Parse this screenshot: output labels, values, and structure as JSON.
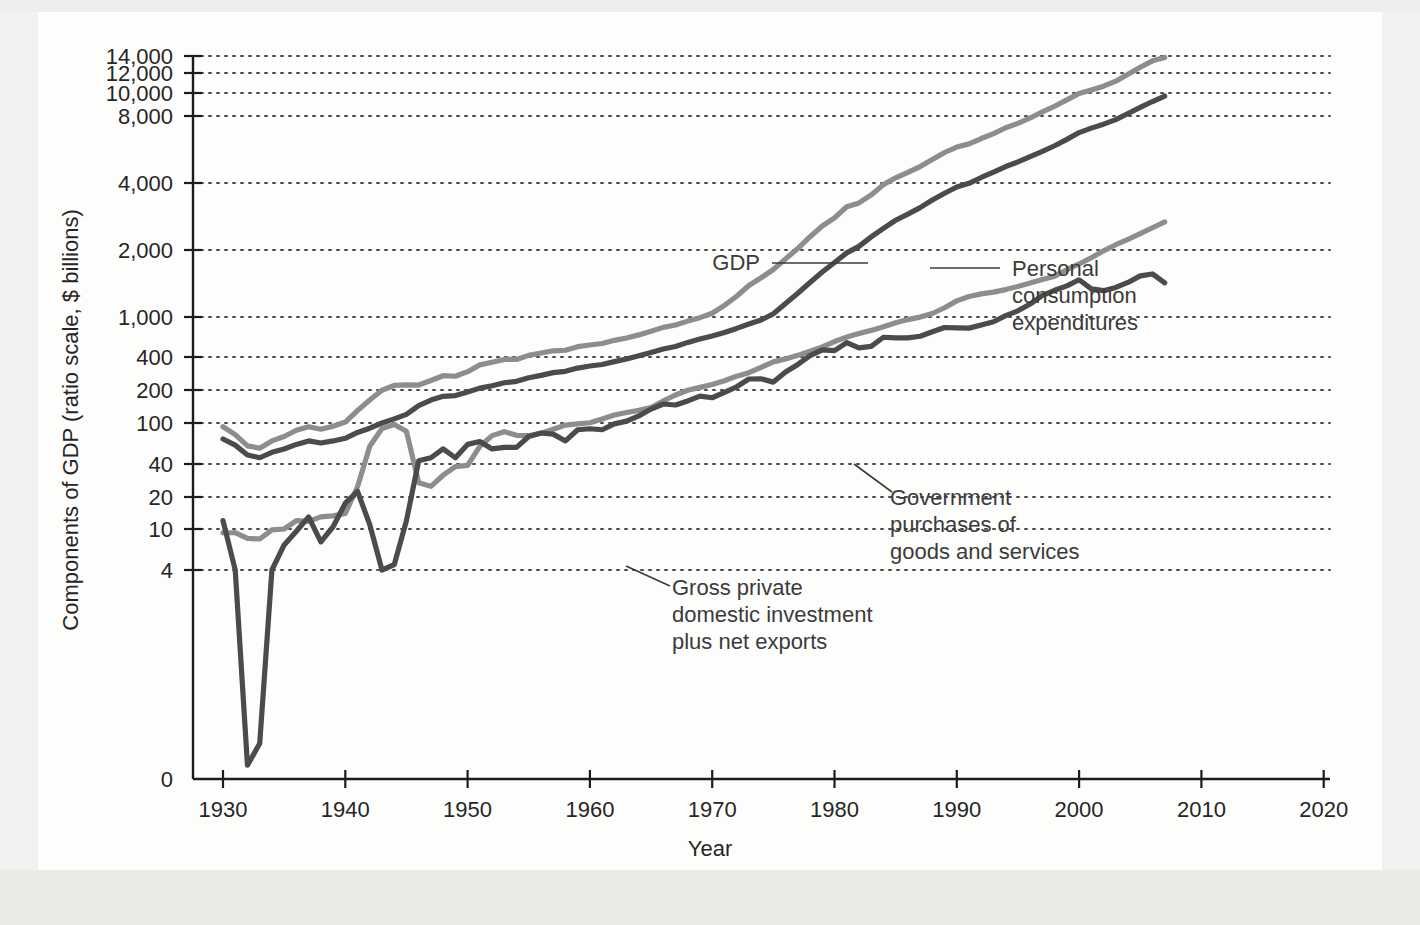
{
  "figure": {
    "y_axis_title": "Components of GDP (ratio scale, $ billions)",
    "x_axis_title": "Year"
  },
  "annotations": {
    "gdp": {
      "label": "GDP"
    },
    "pce": {
      "line1": "Personal",
      "line2": "consumption",
      "line3": "expenditures"
    },
    "gov": {
      "line1": "Government",
      "line2": "purchases of",
      "line3": "goods and services"
    },
    "inv": {
      "line1": "Gross private",
      "line2": "domestic investment",
      "line3": "plus net exports"
    }
  },
  "ticks": {
    "y": [
      "14,000",
      "12,000",
      "10,000",
      "8,000",
      "4,000",
      "2,000",
      "1,000",
      "400",
      "200",
      "100",
      "40",
      "20",
      "10",
      "4",
      "0"
    ],
    "x": [
      "1930",
      "1940",
      "1950",
      "1960",
      "1970",
      "1980",
      "1990",
      "2000",
      "2010",
      "2020"
    ]
  },
  "colors": {
    "light_series": "#8d8d8d",
    "dark_series": "#4b4b4b",
    "axis": "#1c1c1c",
    "grid": "#4a4a4a",
    "panel_background": "#fdfdfc",
    "page_background": "#f2f1ef"
  },
  "chart_data": {
    "type": "line",
    "title": "",
    "xlabel": "Year",
    "ylabel": "Components of GDP (ratio scale, $ billions)",
    "yscale": "log",
    "ylim": [
      4,
      14000
    ],
    "xlim": [
      1928,
      2022
    ],
    "grid": true,
    "legend": "inline-annotations",
    "ytick_values": [
      14000,
      12000,
      10000,
      8000,
      4000,
      2000,
      1000,
      400,
      200,
      100,
      40,
      20,
      10,
      4,
      0
    ],
    "xtick_values": [
      1930,
      1940,
      1950,
      1960,
      1970,
      1980,
      1990,
      2000,
      2010,
      2020
    ],
    "series": [
      {
        "name": "GDP",
        "color": "#8d8d8d",
        "x": [
          1930,
          1931,
          1932,
          1933,
          1934,
          1935,
          1936,
          1937,
          1938,
          1939,
          1940,
          1941,
          1942,
          1943,
          1944,
          1945,
          1946,
          1947,
          1948,
          1949,
          1950,
          1951,
          1952,
          1953,
          1954,
          1955,
          1956,
          1957,
          1958,
          1959,
          1960,
          1961,
          1962,
          1963,
          1964,
          1965,
          1966,
          1967,
          1968,
          1969,
          1970,
          1971,
          1972,
          1973,
          1974,
          1975,
          1976,
          1977,
          1978,
          1979,
          1980,
          1981,
          1982,
          1983,
          1984,
          1985,
          1986,
          1987,
          1988,
          1989,
          1990,
          1991,
          1992,
          1993,
          1994,
          1995,
          1996,
          1997,
          1998,
          1999,
          2000,
          2001,
          2002,
          2003,
          2004,
          2005,
          2006,
          2007
        ],
        "y": [
          92,
          77,
          60,
          57,
          67,
          74,
          85,
          92,
          87,
          93,
          102,
          130,
          162,
          199,
          220,
          223,
          222,
          244,
          270,
          267,
          294,
          339,
          358,
          380,
          380,
          415,
          438,
          461,
          467,
          507,
          527,
          545,
          586,
          618,
          664,
          720,
          788,
          833,
          910,
          985,
          1039,
          1128,
          1240,
          1385,
          1501,
          1635,
          1824,
          2031,
          2295,
          2563,
          2790,
          3128,
          3255,
          3537,
          3933,
          4220,
          4463,
          4740,
          5104,
          5484,
          5803,
          5996,
          6338,
          6667,
          7085,
          7415,
          7839,
          8332,
          8794,
          9354,
          9952,
          10286,
          10642,
          11142,
          11868,
          12638,
          13399,
          13808
        ]
      },
      {
        "name": "Personal consumption expenditures",
        "color": "#4b4b4b",
        "x": [
          1930,
          1931,
          1932,
          1933,
          1934,
          1935,
          1936,
          1937,
          1938,
          1939,
          1940,
          1941,
          1942,
          1943,
          1944,
          1945,
          1946,
          1947,
          1948,
          1949,
          1950,
          1951,
          1952,
          1953,
          1954,
          1955,
          1956,
          1957,
          1958,
          1959,
          1960,
          1961,
          1962,
          1963,
          1964,
          1965,
          1966,
          1967,
          1968,
          1969,
          1970,
          1971,
          1972,
          1973,
          1974,
          1975,
          1976,
          1977,
          1978,
          1979,
          1980,
          1981,
          1982,
          1983,
          1984,
          1985,
          1986,
          1987,
          1988,
          1989,
          1990,
          1991,
          1992,
          1993,
          1994,
          1995,
          1996,
          1997,
          1998,
          1999,
          2000,
          2001,
          2002,
          2003,
          2004,
          2005,
          2006,
          2007
        ],
        "y": [
          70,
          61,
          49,
          46,
          52,
          56,
          62,
          67,
          64,
          67,
          71,
          81,
          89,
          100,
          109,
          120,
          144,
          162,
          175,
          178,
          192,
          208,
          219,
          233,
          240,
          259,
          272,
          288,
          296,
          317,
          331,
          342,
          363,
          383,
          412,
          444,
          481,
          509,
          559,
          604,
          648,
          702,
          770,
          852,
          933,
          1034,
          1151,
          1278,
          1428,
          1592,
          1757,
          1941,
          2077,
          2290,
          2503,
          2720,
          2899,
          3100,
          3353,
          3598,
          3840,
          3986,
          4235,
          4478,
          4743,
          4976,
          5257,
          5547,
          5880,
          6282,
          6739,
          7055,
          7351,
          7704,
          8196,
          8694,
          9207,
          9710
        ]
      },
      {
        "name": "Government purchases of goods and services",
        "color": "#8d8d8d",
        "x": [
          1930,
          1931,
          1932,
          1933,
          1934,
          1935,
          1936,
          1937,
          1938,
          1939,
          1940,
          1941,
          1942,
          1943,
          1944,
          1945,
          1946,
          1947,
          1948,
          1949,
          1950,
          1951,
          1952,
          1953,
          1954,
          1955,
          1956,
          1957,
          1958,
          1959,
          1960,
          1961,
          1962,
          1963,
          1964,
          1965,
          1966,
          1967,
          1968,
          1969,
          1970,
          1971,
          1972,
          1973,
          1974,
          1975,
          1976,
          1977,
          1978,
          1979,
          1980,
          1981,
          1982,
          1983,
          1984,
          1985,
          1986,
          1987,
          1988,
          1989,
          1990,
          1991,
          1992,
          1993,
          1994,
          1995,
          1996,
          1997,
          1998,
          1999,
          2000,
          2001,
          2002,
          2003,
          2004,
          2005,
          2006,
          2007
        ],
        "y": [
          9.2,
          9.2,
          8.1,
          8.0,
          9.8,
          10.0,
          12.0,
          11.8,
          13.0,
          13.3,
          14.0,
          24.8,
          59.6,
          88.6,
          96.5,
          83.0,
          27.0,
          25.0,
          31.6,
          37.8,
          38.8,
          59.4,
          75.4,
          82.4,
          76.0,
          75.3,
          79.5,
          87.1,
          95.3,
          97.9,
          100.6,
          108.6,
          118.3,
          124.6,
          130.3,
          138.4,
          158.9,
          180.1,
          198.8,
          211.3,
          224.9,
          242.7,
          267.6,
          287.6,
          322.4,
          361.1,
          384.5,
          415.3,
          455.6,
          503.5,
          569.7,
          631.4,
          684.4,
          735.9,
          800.8,
          878.3,
          942.3,
          997.9,
          1036.9,
          1100.2,
          1181.4,
          1235.5,
          1270.5,
          1293.0,
          1327.9,
          1372.0,
          1421.9,
          1474.4,
          1526.1,
          1631.3,
          1731.0,
          1846.4,
          1983.3,
          2112.6,
          2232.8,
          2369.9,
          2518.4,
          2674.8
        ]
      },
      {
        "name": "Gross private domestic investment plus net exports",
        "color": "#4b4b4b",
        "x": [
          1930,
          1931,
          1932,
          1933,
          1934,
          1935,
          1936,
          1937,
          1938,
          1939,
          1940,
          1941,
          1942,
          1943,
          1944,
          1945,
          1946,
          1947,
          1948,
          1949,
          1950,
          1951,
          1952,
          1953,
          1954,
          1955,
          1956,
          1957,
          1958,
          1959,
          1960,
          1961,
          1962,
          1963,
          1964,
          1965,
          1966,
          1967,
          1968,
          1969,
          1970,
          1971,
          1972,
          1973,
          1974,
          1975,
          1976,
          1977,
          1978,
          1979,
          1980,
          1981,
          1982,
          1983,
          1984,
          1985,
          1986,
          1987,
          1988,
          1989,
          1990,
          1991,
          1992,
          1993,
          1994,
          1995,
          1996,
          1997,
          1998,
          1999,
          2000,
          2001,
          2002,
          2003,
          2004,
          2005,
          2006,
          2007
        ],
        "y": [
          12.0,
          4.0,
          0.3,
          0.4,
          4.0,
          7.0,
          9.5,
          13.0,
          7.5,
          10.5,
          17.5,
          22.5,
          11.0,
          4.0,
          4.5,
          12.0,
          43.0,
          46.0,
          56.0,
          46.0,
          62.0,
          66.0,
          56.0,
          58.0,
          58.0,
          74.0,
          80.0,
          78.0,
          67.0,
          86.0,
          88.0,
          86.0,
          98.0,
          104.0,
          116.0,
          134.0,
          149.0,
          146.0,
          159.0,
          176.0,
          170.0,
          190.0,
          214.0,
          252.0,
          253.0,
          236.0,
          292.0,
          342.0,
          413.0,
          470.0,
          463.0,
          556.0,
          493.0,
          511.0,
          629.0,
          621.0,
          621.0,
          644.0,
          714.0,
          786.0,
          781.0,
          775.0,
          833.0,
          896.0,
          1015.0,
          1066.0,
          1143.0,
          1250.0,
          1318.0,
          1380.0,
          1470.0,
          1337.0,
          1313.0,
          1358.0,
          1430.0,
          1530.0,
          1561.0,
          1424.0
        ]
      }
    ]
  }
}
